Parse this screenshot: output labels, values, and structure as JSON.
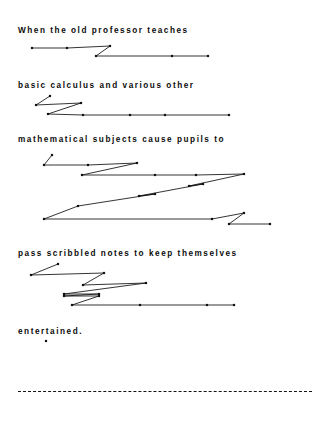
{
  "page": {
    "width": 326,
    "height": 425,
    "background": "#ffffff",
    "ink_color": "#111111"
  },
  "text_lines": [
    {
      "id": "line-1",
      "text": "When the old professor teaches",
      "x": 18,
      "y": 26
    },
    {
      "id": "line-2",
      "text": "basic calculus and various other",
      "x": 18,
      "y": 81
    },
    {
      "id": "line-3",
      "text": "mathematical subjects cause pupils to",
      "x": 18,
      "y": 135
    },
    {
      "id": "line-4",
      "text": "pass scribbled notes to keep themselves",
      "x": 18,
      "y": 249
    },
    {
      "id": "line-5",
      "text": "entertained.",
      "x": 18,
      "y": 327
    }
  ],
  "separator": {
    "id": "dashed-rule",
    "x": 18,
    "y": 391,
    "width": 294,
    "style": "dashed",
    "color": "#141414"
  },
  "scribbles": [
    {
      "id": "scribble-1",
      "points": [
        [
          32,
          48
        ],
        [
          67,
          48
        ],
        [
          110,
          47
        ],
        [
          110,
          47
        ],
        [
          96,
          56
        ],
        [
          172,
          56
        ],
        [
          205,
          56
        ],
        [
          208,
          56
        ],
        [
          209,
          56
        ]
      ],
      "polylines": [
        [
          [
            32,
            48
          ],
          [
            67,
            48
          ],
          [
            110,
            46
          ]
        ],
        [
          [
            110,
            46
          ],
          [
            96,
            56
          ]
        ],
        [
          [
            96,
            56
          ],
          [
            172,
            56
          ],
          [
            208,
            56
          ]
        ]
      ],
      "nodes": [
        [
          32,
          48
        ],
        [
          67,
          48
        ],
        [
          110,
          46
        ],
        [
          96,
          56
        ],
        [
          172,
          56
        ],
        [
          208,
          56
        ]
      ]
    },
    {
      "id": "scribble-2",
      "points": [
        [
          50,
          97
        ],
        [
          36,
          105
        ],
        [
          80,
          103
        ],
        [
          48,
          115
        ],
        [
          83,
          115
        ],
        [
          130,
          115
        ],
        [
          165,
          115
        ],
        [
          229,
          115
        ]
      ],
      "polylines": [
        [
          [
            36,
            105
          ],
          [
            50,
            96
          ]
        ],
        [
          [
            36,
            105
          ],
          [
            81,
            103
          ]
        ],
        [
          [
            81,
            103
          ],
          [
            48,
            114
          ]
        ],
        [
          [
            48,
            114
          ],
          [
            83,
            115
          ],
          [
            130,
            115
          ],
          [
            165,
            115
          ],
          [
            229,
            115
          ]
        ]
      ],
      "nodes": [
        [
          50,
          96
        ],
        [
          36,
          105
        ],
        [
          81,
          103
        ],
        [
          48,
          114
        ],
        [
          83,
          115
        ],
        [
          130,
          115
        ],
        [
          165,
          115
        ],
        [
          229,
          115
        ]
      ]
    },
    {
      "id": "scribble-3",
      "points": [
        [
          51,
          156
        ],
        [
          44,
          165
        ],
        [
          88,
          165
        ],
        [
          130,
          163
        ],
        [
          137,
          163
        ],
        [
          82,
          175
        ],
        [
          155,
          175
        ],
        [
          196,
          175
        ],
        [
          244,
          175
        ],
        [
          189,
          185
        ],
        [
          203,
          185
        ],
        [
          139,
          195
        ],
        [
          155,
          195
        ],
        [
          78,
          206
        ],
        [
          44,
          219
        ],
        [
          212,
          219
        ],
        [
          244,
          213
        ],
        [
          229,
          224
        ],
        [
          270,
          224
        ]
      ],
      "polylines": [
        [
          [
            44,
            165
          ],
          [
            52,
            155
          ]
        ],
        [
          [
            44,
            165
          ],
          [
            88,
            165
          ],
          [
            137,
            163
          ]
        ],
        [
          [
            137,
            163
          ],
          [
            82,
            175
          ]
        ],
        [
          [
            82,
            175
          ],
          [
            155,
            175
          ],
          [
            196,
            175
          ],
          [
            244,
            174
          ]
        ],
        [
          [
            244,
            174
          ],
          [
            189,
            186
          ]
        ],
        [
          [
            189,
            186
          ],
          [
            203,
            184
          ]
        ],
        [
          [
            203,
            184
          ],
          [
            139,
            196
          ]
        ],
        [
          [
            139,
            196
          ],
          [
            155,
            194
          ]
        ],
        [
          [
            155,
            194
          ],
          [
            78,
            206
          ]
        ],
        [
          [
            78,
            206
          ],
          [
            44,
            219
          ]
        ],
        [
          [
            44,
            219
          ],
          [
            212,
            219
          ],
          [
            244,
            213
          ]
        ],
        [
          [
            244,
            213
          ],
          [
            229,
            224
          ]
        ],
        [
          [
            229,
            224
          ],
          [
            270,
            224
          ]
        ]
      ],
      "nodes": [
        [
          52,
          155
        ],
        [
          44,
          165
        ],
        [
          88,
          165
        ],
        [
          137,
          163
        ],
        [
          82,
          175
        ],
        [
          155,
          175
        ],
        [
          196,
          175
        ],
        [
          244,
          174
        ],
        [
          189,
          186
        ],
        [
          203,
          184
        ],
        [
          139,
          196
        ],
        [
          155,
          194
        ],
        [
          78,
          206
        ],
        [
          44,
          219
        ],
        [
          212,
          219
        ],
        [
          244,
          213
        ],
        [
          229,
          224
        ],
        [
          270,
          224
        ]
      ]
    },
    {
      "id": "scribble-4",
      "points": [
        [
          58,
          264
        ],
        [
          31,
          275
        ],
        [
          104,
          274
        ],
        [
          83,
          284
        ],
        [
          146,
          283
        ],
        [
          64,
          294
        ],
        [
          99,
          293
        ],
        [
          72,
          304
        ],
        [
          140,
          304
        ],
        [
          207,
          304
        ],
        [
          234,
          304
        ]
      ],
      "polylines": [
        [
          [
            31,
            275
          ],
          [
            58,
            264
          ]
        ],
        [
          [
            31,
            275
          ],
          [
            104,
            273
          ]
        ],
        [
          [
            104,
            273
          ],
          [
            83,
            285
          ]
        ],
        [
          [
            83,
            285
          ],
          [
            146,
            283
          ]
        ],
        [
          [
            146,
            283
          ],
          [
            64,
            294
          ]
        ],
        [
          [
            64,
            294
          ],
          [
            99,
            294
          ]
        ],
        [
          [
            99,
            294
          ],
          [
            64,
            296
          ]
        ],
        [
          [
            64,
            296
          ],
          [
            99,
            296
          ]
        ],
        [
          [
            99,
            296
          ],
          [
            72,
            305
          ]
        ],
        [
          [
            72,
            305
          ],
          [
            140,
            305
          ],
          [
            207,
            305
          ],
          [
            234,
            305
          ]
        ]
      ],
      "nodes": [
        [
          58,
          264
        ],
        [
          31,
          275
        ],
        [
          104,
          273
        ],
        [
          83,
          285
        ],
        [
          146,
          283
        ],
        [
          64,
          294
        ],
        [
          99,
          294
        ],
        [
          64,
          296
        ],
        [
          99,
          296
        ],
        [
          72,
          305
        ],
        [
          140,
          305
        ],
        [
          207,
          305
        ],
        [
          234,
          305
        ]
      ]
    },
    {
      "id": "scribble-5",
      "points": [
        [
          46,
          341
        ]
      ],
      "polylines": [],
      "nodes": [
        [
          46,
          341
        ]
      ]
    }
  ]
}
